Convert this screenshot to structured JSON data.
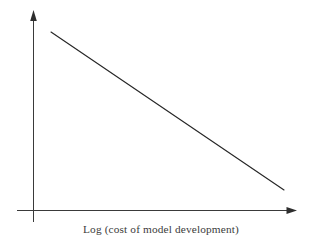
{
  "figure": {
    "background_color": "#ffffff",
    "width": 309,
    "height": 246
  },
  "axes": {
    "line_color": "#3a3a3a",
    "y_axis_name": "y-axis-arrow",
    "x_axis_name": "x-axis-arrow",
    "y_axis_label": "",
    "x_axis_label": "Log (cost of model development)"
  },
  "chart_data": {
    "type": "line",
    "title": "",
    "subtitle": "",
    "xlabel": "Log (cost of model development)",
    "ylabel": "",
    "grid": false,
    "legend": null,
    "axis_style": "arrow-headed schematic axes, no tick marks, no tick labels",
    "xlim": [
      0,
      1
    ],
    "ylim": [
      0,
      1
    ],
    "annotations": [],
    "series": [
      {
        "name": "downward trend",
        "color": "#262626",
        "x": [
          0.071,
          1.0
        ],
        "y": [
          1.0,
          0.16
        ],
        "points_px": [
          [
            51,
            32
          ],
          [
            284,
            190
          ]
        ],
        "description": "single straight line decreasing monotonically from upper left to lower right"
      }
    ]
  }
}
